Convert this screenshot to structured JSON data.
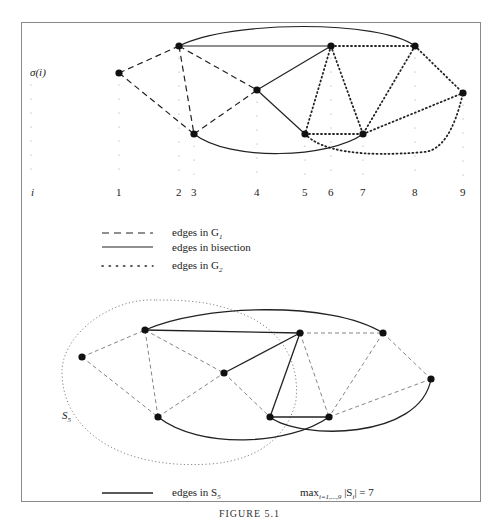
{
  "figure": {
    "caption": "FIGURE 5.1",
    "frame_color": "#8a8a8a"
  },
  "top_panel": {
    "y_axis_label": "σ(i)",
    "x_axis_label": "i",
    "index_ticks": [
      "1",
      "2",
      "3",
      "4",
      "5",
      "6",
      "7",
      "8",
      "9"
    ],
    "nodes": [
      {
        "id": 1,
        "x": 119,
        "y": 73
      },
      {
        "id": 2,
        "x": 179,
        "y": 46
      },
      {
        "id": 3,
        "x": 194,
        "y": 134
      },
      {
        "id": 4,
        "x": 257,
        "y": 90
      },
      {
        "id": 5,
        "x": 305,
        "y": 134
      },
      {
        "id": 6,
        "x": 331,
        "y": 46
      },
      {
        "id": 7,
        "x": 363,
        "y": 134
      },
      {
        "id": 8,
        "x": 415,
        "y": 46
      },
      {
        "id": 9,
        "x": 463,
        "y": 93
      }
    ],
    "edges_G1": [
      [
        1,
        2
      ],
      [
        1,
        3
      ],
      [
        2,
        3
      ],
      [
        2,
        4
      ],
      [
        3,
        4
      ]
    ],
    "edges_bisection": [
      [
        2,
        6
      ],
      [
        2,
        8
      ],
      [
        4,
        6
      ],
      [
        4,
        5
      ],
      [
        3,
        7
      ]
    ],
    "edges_G2": [
      [
        6,
        8
      ],
      [
        6,
        5
      ],
      [
        6,
        7
      ],
      [
        8,
        7
      ],
      [
        8,
        9
      ],
      [
        5,
        7
      ],
      [
        7,
        9
      ],
      [
        5,
        9
      ]
    ]
  },
  "legend": {
    "items": [
      {
        "style": "dashed",
        "label": "edges in G",
        "sub": "1"
      },
      {
        "style": "solid",
        "label": "edges in bisection",
        "sub": ""
      },
      {
        "style": "dotted",
        "label": "edges in G",
        "sub": "2"
      }
    ]
  },
  "bottom_panel": {
    "region_label": "S",
    "region_sub": "5",
    "nodes": [
      {
        "id": 1,
        "x": 82,
        "y": 357
      },
      {
        "id": 2,
        "x": 145,
        "y": 330
      },
      {
        "id": 3,
        "x": 158,
        "y": 417
      },
      {
        "id": 4,
        "x": 224,
        "y": 373
      },
      {
        "id": 5,
        "x": 270,
        "y": 417
      },
      {
        "id": 6,
        "x": 300,
        "y": 333
      },
      {
        "id": 7,
        "x": 329,
        "y": 417
      },
      {
        "id": 8,
        "x": 383,
        "y": 333
      },
      {
        "id": 9,
        "x": 431,
        "y": 379
      }
    ],
    "edges_S5": [
      [
        2,
        6
      ],
      [
        2,
        8
      ],
      [
        4,
        6
      ],
      [
        6,
        5
      ],
      [
        5,
        7
      ],
      [
        3,
        7
      ],
      [
        5,
        9
      ]
    ],
    "edges_other": [
      [
        1,
        2
      ],
      [
        1,
        3
      ],
      [
        2,
        3
      ],
      [
        2,
        4
      ],
      [
        3,
        4
      ],
      [
        4,
        5
      ],
      [
        6,
        8
      ],
      [
        6,
        7
      ],
      [
        8,
        7
      ],
      [
        8,
        9
      ],
      [
        7,
        9
      ]
    ],
    "legend_label": "edges in S",
    "legend_sub": "5",
    "max_expression": {
      "prefix": "max",
      "subscript": "i=1,...,9",
      "body": "|S",
      "body_sub": "i",
      "suffix": "| = 7"
    }
  }
}
